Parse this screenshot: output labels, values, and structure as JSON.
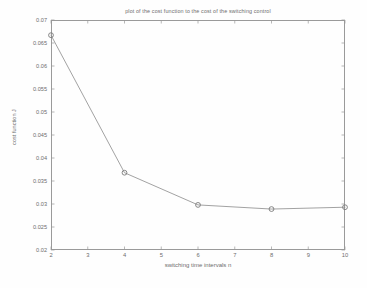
{
  "chart_data": {
    "type": "line",
    "title": "plot of the cost function to the cost of the switching control",
    "xlabel": "switching time intervals n",
    "ylabel": "cost function J",
    "x": [
      2,
      4,
      6,
      8,
      10
    ],
    "values": [
      0.0667,
      0.0368,
      0.0298,
      0.0289,
      0.0293
    ],
    "series": [
      {
        "name": "cost function J",
        "values": [
          0.0667,
          0.0368,
          0.0298,
          0.0289,
          0.0293
        ]
      }
    ],
    "xlim": [
      2,
      10
    ],
    "ylim": [
      0.02,
      0.07
    ],
    "xticks": [
      2,
      3,
      4,
      5,
      6,
      7,
      8,
      9,
      10
    ],
    "xtick_labels": [
      "2",
      "3",
      "4",
      "5",
      "6",
      "7",
      "8",
      "9",
      "10"
    ],
    "yticks": [
      0.02,
      0.025,
      0.03,
      0.035,
      0.04,
      0.045,
      0.05,
      0.055,
      0.06,
      0.065,
      0.07
    ],
    "ytick_labels": [
      "0.02",
      "0.025",
      "0.03",
      "0.035",
      "0.04",
      "0.045",
      "0.05",
      "0.055",
      "0.06",
      "0.065",
      "0.07"
    ],
    "grid": false,
    "legend": "none",
    "marker": "circle",
    "line_color": "#8a8a8a",
    "marker_color": "#7a7a7a",
    "axis_color": "#9a9a9a",
    "text_color": "#6d6d6d",
    "background": "#ffffff"
  }
}
